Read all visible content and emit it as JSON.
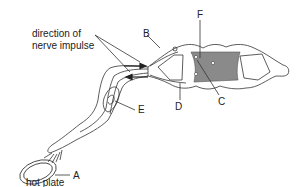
{
  "diagram": {
    "labels": {
      "direction": [
        "direction of",
        "nerve impulse"
      ],
      "A": "A",
      "B": "B",
      "C": "C",
      "D": "D",
      "E": "E",
      "F": "F",
      "hot_plate": "hot plate"
    },
    "colors": {
      "line": "#333333",
      "grey_matter": "#8a8a8a",
      "background": "#ffffff"
    }
  }
}
